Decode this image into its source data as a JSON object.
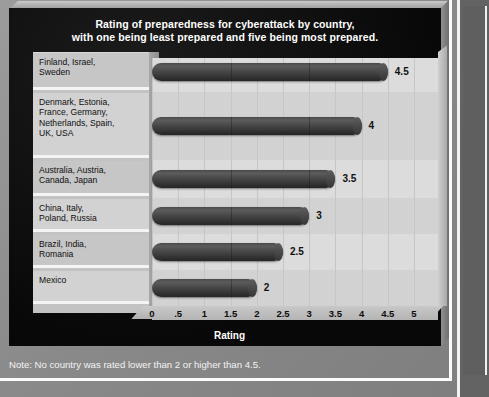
{
  "chart": {
    "title_line1": "Rating of preparedness for cyberattack by country,",
    "title_line2": "with one being least prepared and five being most prepared.",
    "axis_title": "Rating",
    "note": "Note: No country was rated lower than 2 or higher than 4.5."
  },
  "chart_data": {
    "type": "bar",
    "orientation": "horizontal",
    "title": "Rating of preparedness for cyberattack by country, with one being least prepared and five being most prepared.",
    "xlabel": "Rating",
    "ylabel": "",
    "xlim": [
      0,
      5
    ],
    "grid": true,
    "legend": null,
    "annotation": "Note: No country was rated lower than 2 or higher than 4.5.",
    "categories": [
      "Finland, Israel, Sweden",
      "Denmark, Estonia, France, Germany, Netherlands, Spain, UK, USA",
      "Australia, Austria, Canada, Japan",
      "China, Italy, Poland, Russia",
      "Brazil, India, Romania",
      "Mexico"
    ],
    "values": [
      4.5,
      4,
      3.5,
      3,
      2.5,
      2
    ],
    "value_labels": [
      "4.5",
      "4",
      "3.5",
      "3",
      "2.5",
      "2"
    ],
    "tick_labels": [
      "0",
      ".5",
      "1",
      "1.5",
      "2",
      "2.5",
      "3",
      "3.5",
      "4",
      "4.5",
      "5"
    ],
    "tick_values": [
      0,
      0.5,
      1,
      1.5,
      2,
      2.5,
      3,
      3.5,
      4,
      4.5,
      5
    ],
    "bar_color": "#444444",
    "panel_color": "#dcdcdc",
    "background_color": "#0c0c0c"
  },
  "rows": [
    {
      "label_line1": "Finland, Israel,",
      "label_line2": "Sweden",
      "label_line3": "",
      "label_line4": "",
      "value_label": "4.5"
    },
    {
      "label_line1": "Denmark, Estonia,",
      "label_line2": "France, Germany,",
      "label_line3": "Netherlands, Spain,",
      "label_line4": "UK, USA",
      "value_label": "4"
    },
    {
      "label_line1": "Australia, Austria,",
      "label_line2": "Canada, Japan",
      "label_line3": "",
      "label_line4": "",
      "value_label": "3.5"
    },
    {
      "label_line1": "China, Italy,",
      "label_line2": "Poland, Russia",
      "label_line3": "",
      "label_line4": "",
      "value_label": "3"
    },
    {
      "label_line1": "Brazil, India,",
      "label_line2": "Romania",
      "label_line3": "",
      "label_line4": "",
      "value_label": "2.5"
    },
    {
      "label_line1": "Mexico",
      "label_line2": "",
      "label_line3": "",
      "label_line4": "",
      "value_label": "2"
    }
  ]
}
